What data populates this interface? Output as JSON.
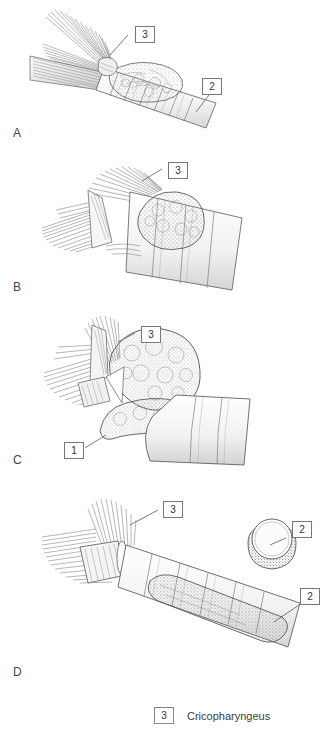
{
  "figure": {
    "background_color": "#ffffff",
    "ink_color": "#3a3a3a"
  },
  "panels": [
    {
      "letter": "A",
      "description": "Lateral view of pharyngoesophageal junction with cricopharyngeus muscle and small diverticulum on trachea-like segmented tube",
      "callouts": [
        {
          "number": "3",
          "target": "cricopharyngeus"
        },
        {
          "number": "2",
          "target": "esophagus"
        }
      ]
    },
    {
      "letter": "B",
      "description": "Diverticulum enlarged, cricopharyngeus fibers retracted",
      "callouts": [
        {
          "number": "3",
          "target": "cricopharyngeus"
        }
      ]
    },
    {
      "letter": "C",
      "description": "Large diverticular sac retracted superiorly, myotomy exposed",
      "callouts": [
        {
          "number": "3",
          "target": "cricopharyngeus"
        },
        {
          "number": "1",
          "target": "diverticulum-neck"
        }
      ]
    },
    {
      "letter": "D",
      "description": "Completed repair with stapled esophagus and cross-sectional inset",
      "callouts": [
        {
          "number": "3",
          "target": "cricopharyngeus"
        },
        {
          "number": "2",
          "target": "esophagus-inset"
        },
        {
          "number": "2",
          "target": "esophagus"
        }
      ]
    }
  ],
  "legend": {
    "items": [
      {
        "number": "3",
        "label": "Cricopharyngeus"
      }
    ]
  }
}
